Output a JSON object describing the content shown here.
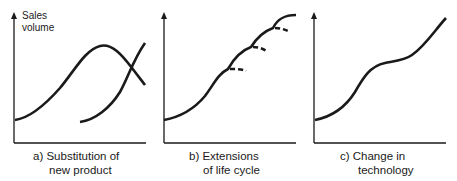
{
  "figure": {
    "y_axis_label_line1": "Sales",
    "y_axis_label_line2": "volume",
    "panels": [
      {
        "id": "a",
        "caption_line1": "a) Substitution of",
        "caption_line2": "new product"
      },
      {
        "id": "b",
        "caption_line1": "b) Extensions",
        "caption_line2": "of life cycle"
      },
      {
        "id": "c",
        "caption_line1": "c) Change in",
        "caption_line2": "technology"
      }
    ],
    "colors": {
      "ink": "#1a1a1a",
      "background": "#ffffff"
    }
  }
}
